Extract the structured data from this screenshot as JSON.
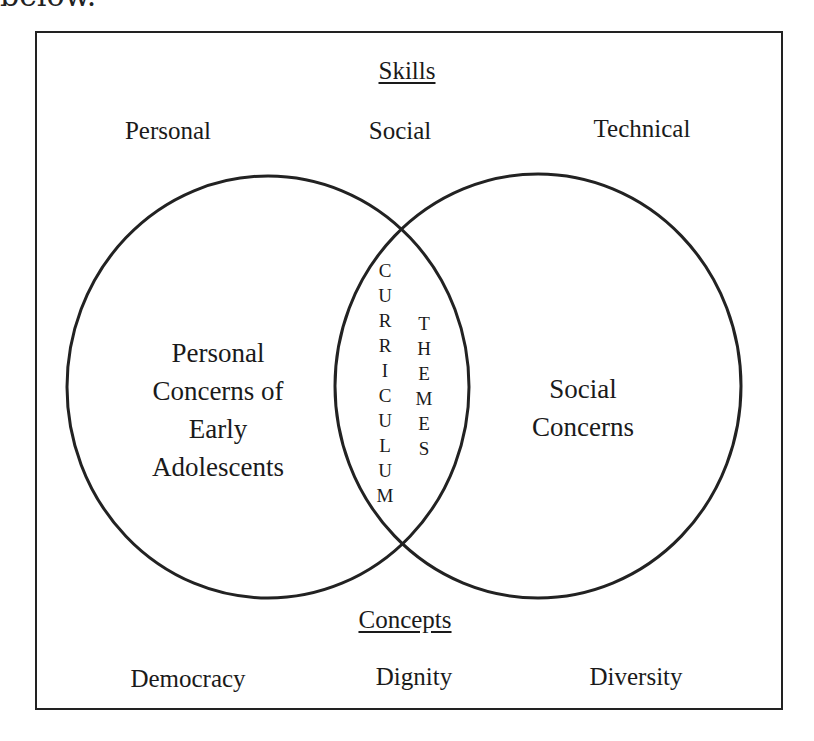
{
  "clipped_text": "below.",
  "skills": {
    "header": "Skills",
    "items": [
      "Personal",
      "Social",
      "Technical"
    ]
  },
  "circles": {
    "left": {
      "label_lines": [
        "Personal",
        "Concerns of",
        "Early",
        "Adolescents"
      ]
    },
    "right": {
      "label_lines": [
        "Social",
        "Concerns"
      ]
    },
    "intersection": {
      "word1": "CURRICULUM",
      "word2": "THEMES"
    }
  },
  "concepts": {
    "header": "Concepts",
    "items": [
      "Democracy",
      "Dignity",
      "Diversity"
    ]
  },
  "colors": {
    "stroke": "#222222",
    "background": "#ffffff"
  }
}
